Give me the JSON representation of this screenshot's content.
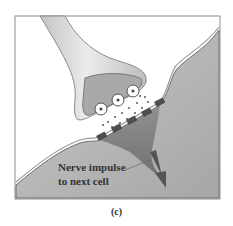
{
  "figure": {
    "type": "diagram",
    "labels": {
      "impulse_line1": "Nerve impulse",
      "impulse_line2": "to next cell"
    },
    "caption": "(c)",
    "colors": {
      "background_panel": "#e8e8e8",
      "axon": "#d8d8d8",
      "terminal_inner": "#a8a8a8",
      "postsynaptic_cell": "#b4b4b4",
      "dendrite_dark": "#7a7a7a",
      "receptor": "#555555",
      "neurotransmitter": "#666666",
      "arrow": "#5a5a5a",
      "frame": "#888888"
    }
  }
}
